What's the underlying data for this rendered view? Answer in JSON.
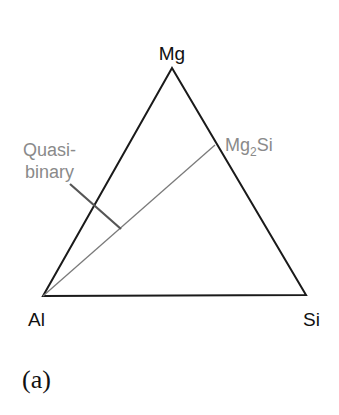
{
  "diagram": {
    "type": "ternary-system",
    "vertices": {
      "top": "Mg",
      "bottom_left": "Al",
      "bottom_right": "Si"
    },
    "compound": {
      "base": "Mg",
      "subscript": "2",
      "suffix": "Si",
      "full": "Mg2Si"
    },
    "annotation": {
      "line1": "Quasi-",
      "line2": "binary"
    },
    "panel_label": "(a)",
    "colors": {
      "triangle": "#1a1a1a",
      "quasibinary_line": "#7a7a7a",
      "leader_line": "#555555",
      "gray_text": "#8a8a8a",
      "black_text": "#111111"
    }
  }
}
